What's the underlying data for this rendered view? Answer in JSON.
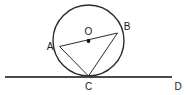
{
  "figure": {
    "type": "geometry-diagram",
    "background_color": "#ffffff",
    "stroke_color": "#2b2b2b",
    "label_color": "#1a1a1a",
    "circle": {
      "name": "circle-O",
      "center_x": 88.5,
      "center_y": 40.5,
      "radius": 35.5,
      "stroke_width": 1.3,
      "fill": "none"
    },
    "center_point": {
      "name": "point-O",
      "x": 88.5,
      "y": 41,
      "dot_radius": 1.8
    },
    "points": [
      {
        "id": "A",
        "label": "A",
        "x": 59.5,
        "y": 46.5,
        "label_x": 50,
        "label_y": 50,
        "anchor": "middle"
      },
      {
        "id": "B",
        "label": "B",
        "x": 117.5,
        "y": 33.0,
        "label_x": 127,
        "label_y": 30,
        "anchor": "middle"
      },
      {
        "id": "C",
        "label": "C",
        "x": 88.5,
        "y": 76.0,
        "label_x": 88.5,
        "label_y": 90,
        "anchor": "middle"
      },
      {
        "id": "O",
        "label": "O",
        "x": 88.5,
        "y": 41.0,
        "label_x": 88.5,
        "label_y": 35,
        "anchor": "middle"
      },
      {
        "id": "D",
        "label": "D",
        "x": 172,
        "y": 77,
        "label_x": 178,
        "label_y": 90,
        "anchor": "middle"
      }
    ],
    "segments": [
      {
        "name": "segment-AB",
        "from": "A",
        "to": "B",
        "x1": 59.5,
        "y1": 46.5,
        "x2": 117.5,
        "y2": 33.0,
        "stroke_width": 1.0
      },
      {
        "name": "segment-AC",
        "from": "A",
        "to": "C",
        "x1": 59.5,
        "y1": 46.5,
        "x2": 88.5,
        "y2": 76.0,
        "stroke_width": 1.0
      },
      {
        "name": "segment-BC",
        "from": "B",
        "to": "C",
        "x1": 117.5,
        "y1": 33.0,
        "x2": 88.5,
        "y2": 76.0,
        "stroke_width": 1.0
      }
    ],
    "tangent_line": {
      "name": "tangent-line-CD",
      "x1": 5,
      "y1": 77,
      "x2": 172,
      "y2": 77,
      "stroke_width": 1.6,
      "touch_point": "C"
    }
  }
}
